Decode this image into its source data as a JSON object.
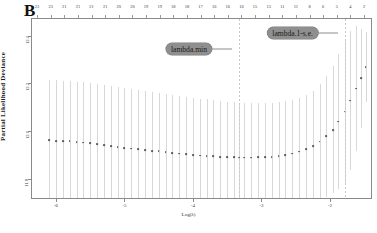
{
  "figure": {
    "panel_label": "B",
    "type": "cv-glmnet-plot"
  },
  "axes": {
    "y_title": "Partial Likelihood Deviance",
    "x_title": "Log(λ)",
    "y_ticks": [
      "12.4",
      "12.2",
      "12.0",
      "11.8"
    ],
    "x_ticks": [
      "-6",
      "-5",
      "-4",
      "-3",
      "-2"
    ]
  },
  "annotations": [
    {
      "label": "lambda.min",
      "box_x": 212,
      "box_y": 49,
      "line_to": 216
    },
    {
      "label": "lambda.1-s.e.",
      "box_x": 318,
      "box_y": 33,
      "line_to": 322
    }
  ],
  "chart_data": {
    "type": "line",
    "title": "",
    "subtitle": "",
    "xlabel": "Log(λ)",
    "ylabel": "Partial Likelihood Deviance",
    "xlim": [
      -6.35,
      -1.4
    ],
    "ylim": [
      11.72,
      12.47
    ],
    "grid": false,
    "legend_position": "none",
    "top_axis_label": "Number of non-zero coefficients",
    "top_axis_ticks": [
      23,
      23,
      21,
      21,
      21,
      21,
      20,
      20,
      19,
      19,
      18,
      18,
      17,
      16,
      16,
      16,
      15,
      13,
      11,
      11,
      8,
      6,
      5,
      4,
      2
    ],
    "vlines": [
      {
        "name": "lambda.min",
        "x": -3.33
      },
      {
        "name": "lambda.1se",
        "x": -1.78
      }
    ],
    "x": [
      -6.1,
      -6.0,
      -5.9,
      -5.8,
      -5.7,
      -5.6,
      -5.5,
      -5.4,
      -5.3,
      -5.2,
      -5.1,
      -5.0,
      -4.9,
      -4.8,
      -4.7,
      -4.6,
      -4.5,
      -4.4,
      -4.3,
      -4.2,
      -4.1,
      -4.0,
      -3.9,
      -3.8,
      -3.7,
      -3.6,
      -3.5,
      -3.4,
      -3.33,
      -3.25,
      -3.15,
      -3.05,
      -2.95,
      -2.85,
      -2.75,
      -2.65,
      -2.55,
      -2.45,
      -2.35,
      -2.25,
      -2.15,
      -2.05,
      -1.95,
      -1.88,
      -1.78,
      -1.7,
      -1.62,
      -1.55,
      -1.48
    ],
    "cvm": [
      11.962,
      11.96,
      11.958,
      11.957,
      11.955,
      11.952,
      11.949,
      11.946,
      11.942,
      11.938,
      11.934,
      11.93,
      11.927,
      11.924,
      11.921,
      11.918,
      11.915,
      11.912,
      11.909,
      11.906,
      11.903,
      11.9,
      11.898,
      11.896,
      11.894,
      11.892,
      11.891,
      11.89,
      11.889,
      11.889,
      11.889,
      11.89,
      11.891,
      11.893,
      11.896,
      11.9,
      11.906,
      11.914,
      11.924,
      11.938,
      11.956,
      11.978,
      12.006,
      12.04,
      12.082,
      12.128,
      12.178,
      12.222,
      12.268
    ],
    "cvup": [
      12.214,
      12.213,
      12.212,
      12.21,
      12.208,
      12.205,
      12.202,
      12.198,
      12.194,
      12.19,
      12.185,
      12.18,
      12.176,
      12.172,
      12.168,
      12.164,
      12.16,
      12.156,
      12.152,
      12.148,
      12.144,
      12.14,
      12.136,
      12.133,
      12.13,
      12.127,
      12.124,
      12.122,
      12.12,
      12.119,
      12.118,
      12.118,
      12.119,
      12.12,
      12.122,
      12.126,
      12.132,
      12.14,
      12.152,
      12.17,
      12.196,
      12.23,
      12.272,
      12.322,
      12.38,
      12.42,
      12.44,
      12.43,
      12.415
    ],
    "cvlo": [
      11.71,
      11.707,
      11.704,
      11.704,
      11.702,
      11.699,
      11.696,
      11.694,
      11.69,
      11.686,
      11.683,
      11.68,
      11.678,
      11.676,
      11.674,
      11.672,
      11.67,
      11.668,
      11.666,
      11.664,
      11.662,
      11.66,
      11.66,
      11.659,
      11.658,
      11.657,
      11.658,
      11.658,
      11.658,
      11.659,
      11.66,
      11.662,
      11.663,
      11.666,
      11.67,
      11.674,
      11.68,
      11.688,
      11.696,
      11.706,
      11.716,
      11.726,
      11.74,
      11.758,
      11.784,
      11.836,
      11.916,
      12.014,
      12.121
    ]
  }
}
